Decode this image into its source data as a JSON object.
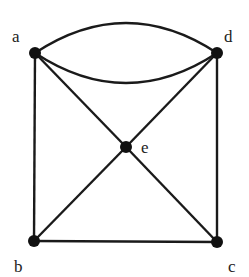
{
  "graph": {
    "nodes": [
      {
        "id": "a",
        "label": "a",
        "x": 35,
        "y": 53,
        "lx": 12,
        "ly": 42
      },
      {
        "id": "d",
        "label": "d",
        "x": 217,
        "y": 53,
        "lx": 224,
        "ly": 42
      },
      {
        "id": "e",
        "label": "e",
        "x": 126,
        "y": 147,
        "lx": 141,
        "ly": 153
      },
      {
        "id": "b",
        "label": "b",
        "x": 34,
        "y": 241,
        "lx": 14,
        "ly": 272
      },
      {
        "id": "c",
        "label": "c",
        "x": 217,
        "y": 242,
        "lx": 228,
        "ly": 272
      }
    ],
    "edges": [
      {
        "from": "a",
        "to": "d",
        "type": "curve",
        "ctrl_y": -7
      },
      {
        "from": "a",
        "to": "d",
        "type": "curve",
        "ctrl_y": 113
      },
      {
        "from": "a",
        "to": "b",
        "type": "line"
      },
      {
        "from": "d",
        "to": "c",
        "type": "line"
      },
      {
        "from": "b",
        "to": "c",
        "type": "line"
      },
      {
        "from": "a",
        "to": "e",
        "type": "line"
      },
      {
        "from": "e",
        "to": "c",
        "type": "line"
      },
      {
        "from": "d",
        "to": "e",
        "type": "line"
      },
      {
        "from": "e",
        "to": "b",
        "type": "line"
      }
    ]
  }
}
